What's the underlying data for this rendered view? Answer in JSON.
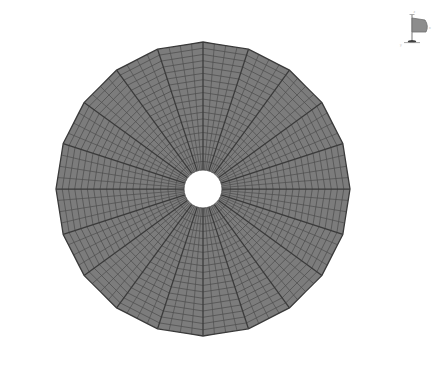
{
  "view": {
    "title": "Mesh Viewport",
    "background_color": "#ffffff",
    "width": 440,
    "height": 372
  },
  "mesh": {
    "name": "annular-disk-mesh",
    "label": "Annular polygonal disk mesh",
    "fill_color": "#7c7c7c",
    "line_color": "#4a4a4a",
    "major_line_color": "#3a3a3a",
    "outline_color": "#3a3a3a",
    "hole_color": "#ffffff",
    "center_x": 203,
    "center_y": 189,
    "outer_radius": 147,
    "inner_radius": 19,
    "outer_polygon_sides": 20,
    "major_sectors": 20,
    "minor_divisions_per_sector": 4,
    "radial_rings": 19,
    "sector_angle_deg": 18,
    "start_angle_deg": -90
  },
  "orientation_widget": {
    "name": "orientation-axes-triad",
    "label": "Orientation axes",
    "x_axis_label": "x",
    "y_axis_label": "y",
    "z_axis_label": "z",
    "stem_color": "#6d6d6d",
    "fan_color": "#8a8a8a",
    "base_color": "#4a4a4a"
  }
}
